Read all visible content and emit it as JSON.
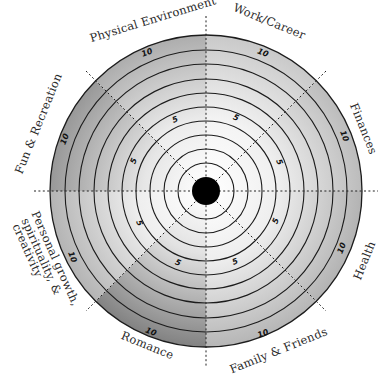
{
  "diagram": {
    "type": "wheel-of-life",
    "center": {
      "x": 206,
      "y": 191
    },
    "outer_radius": 156,
    "ring_count": 10,
    "scale_labels": {
      "mid": "5",
      "max": "10"
    },
    "categories": [
      {
        "id": "work",
        "label": "Work/Career",
        "start_deg": -90,
        "end_deg": -45,
        "tone_outer": "#c9c9c9"
      },
      {
        "id": "finances",
        "label": "Finances",
        "start_deg": -45,
        "end_deg": 0,
        "tone_outer": "#bcbcbc"
      },
      {
        "id": "health",
        "label": "Health",
        "start_deg": 0,
        "end_deg": 45,
        "tone_outer": "#b3b3b3"
      },
      {
        "id": "family",
        "label": "Family & Friends",
        "start_deg": 45,
        "end_deg": 90,
        "tone_outer": "#b6b6b6"
      },
      {
        "id": "romance",
        "label": "Romance",
        "start_deg": 90,
        "end_deg": 135,
        "tone_outer": "#828282"
      },
      {
        "id": "personal",
        "label_lines": [
          "Personal growth,",
          "spirituality, &",
          "creativity"
        ],
        "start_deg": 135,
        "end_deg": 180,
        "tone_outer": "#b4b4b4"
      },
      {
        "id": "fun",
        "label": "Fun & Recreation",
        "start_deg": 180,
        "end_deg": 225,
        "tone_outer": "#989898"
      },
      {
        "id": "physical",
        "label": "Physical Environment",
        "start_deg": 225,
        "end_deg": 270,
        "tone_outer": "#adadad"
      }
    ],
    "colors": {
      "ring_stroke": "#1c1c1c",
      "center_dot": "#000000",
      "inner_tone": "#ffffff"
    }
  }
}
